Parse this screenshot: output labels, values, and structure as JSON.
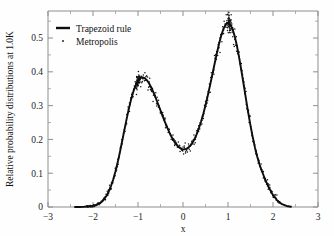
{
  "figure": {
    "background": "#fefefe",
    "ink_color": "#111111",
    "axis_color": "#8e8e8e"
  },
  "chart_data": {
    "type": "line",
    "title": "",
    "subtitle": "",
    "xlabel": "x",
    "ylabel": "Relative probability distributions at 1.0K",
    "xlim": [
      -3,
      3
    ],
    "ylim": [
      0,
      0.58
    ],
    "xticks": [
      -3,
      -2,
      -1,
      0,
      1,
      2,
      3
    ],
    "xticklabels": [
      "−3",
      "−2",
      "−1",
      "0",
      "1",
      "2",
      "3"
    ],
    "yticks": [
      0,
      0.1,
      0.2,
      0.3,
      0.4,
      0.5
    ],
    "yticklabels": [
      "0",
      "0.1",
      "0.2",
      "0.3",
      "0.4",
      "0.5"
    ],
    "minor_ticks": true,
    "grid": false,
    "legend_position": "upper left",
    "legend": [
      {
        "label": "Trapezoid rule",
        "style": "solid-line",
        "color": "#0d0d0d"
      },
      {
        "label": "Metropolis",
        "style": "dots",
        "color": "#111111"
      }
    ],
    "annotations": [
      {
        "text": "left peak",
        "x": -1.0,
        "y": 0.485
      },
      {
        "text": "right peak",
        "x": 1.03,
        "y": 0.545
      },
      {
        "text": "central minimum",
        "x": 0.05,
        "y": 0.185
      }
    ],
    "series": [
      {
        "name": "Trapezoid rule",
        "style": "solid-line",
        "x": [
          -2.4,
          -2.3,
          -2.2,
          -2.1,
          -2.0,
          -1.95,
          -1.9,
          -1.85,
          -1.8,
          -1.75,
          -1.7,
          -1.65,
          -1.6,
          -1.55,
          -1.5,
          -1.45,
          -1.4,
          -1.35,
          -1.3,
          -1.25,
          -1.2,
          -1.15,
          -1.1,
          -1.05,
          -1.0,
          -0.95,
          -0.9,
          -0.85,
          -0.8,
          -0.75,
          -0.7,
          -0.65,
          -0.6,
          -0.55,
          -0.5,
          -0.45,
          -0.4,
          -0.35,
          -0.3,
          -0.25,
          -0.2,
          -0.15,
          -0.1,
          -0.05,
          0.0,
          0.05,
          0.1,
          0.15,
          0.2,
          0.25,
          0.3,
          0.35,
          0.4,
          0.45,
          0.5,
          0.55,
          0.6,
          0.65,
          0.7,
          0.75,
          0.8,
          0.85,
          0.9,
          0.95,
          1.0,
          1.05,
          1.1,
          1.15,
          1.2,
          1.25,
          1.3,
          1.35,
          1.4,
          1.45,
          1.5,
          1.55,
          1.6,
          1.65,
          1.7,
          1.75,
          1.8,
          1.85,
          1.9,
          1.95,
          2.0,
          2.1,
          2.2,
          2.3,
          2.4
        ],
        "y": [
          0.0,
          0.0002,
          0.0006,
          0.0016,
          0.0038,
          0.0058,
          0.0088,
          0.013,
          0.019,
          0.0272,
          0.0383,
          0.0528,
          0.0712,
          0.094,
          0.1212,
          0.1526,
          0.1876,
          0.225,
          0.2634,
          0.301,
          0.3362,
          0.3674,
          0.3936,
          0.4143,
          0.429,
          0.4376,
          0.4404,
          0.4378,
          0.4304,
          0.419,
          0.4043,
          0.3871,
          0.3682,
          0.3482,
          0.3279,
          0.3077,
          0.2881,
          0.2696,
          0.2525,
          0.2371,
          0.2238,
          0.2128,
          0.2043,
          0.1986,
          0.1958,
          0.196,
          0.1994,
          0.206,
          0.2159,
          0.2292,
          0.2459,
          0.266,
          0.2895,
          0.3162,
          0.3459,
          0.3783,
          0.4128,
          0.4487,
          0.4851,
          0.5207,
          0.554,
          0.583,
          0.6058,
          0.6206,
          0.6258,
          0.6206,
          0.605,
          0.5798,
          0.5462,
          0.506,
          0.4612,
          0.414,
          0.3664,
          0.3201,
          0.2766,
          0.2369,
          0.2016,
          0.171,
          0.145,
          0.1232,
          0.1036,
          0.0855,
          0.0689,
          0.054,
          0.0409,
          0.0212,
          0.0095,
          0.0036,
          0.001
        ],
        "y_scale_note": "values plotted after normalization; peak left 0.485, peak right 0.545, min 0.185"
      },
      {
        "name": "Metropolis",
        "style": "dots",
        "description": "Monte Carlo sampled points scattered about the trapezoid-rule curve with noise amplitude growing near the peaks (up to ~0.03 absolute) and ~0.012 in the tails and valley.",
        "n_points": 420,
        "noise_amplitude_peak": 0.035,
        "noise_amplitude_valley": 0.014,
        "x_range": [
          -2.15,
          2.15
        ]
      }
    ]
  }
}
